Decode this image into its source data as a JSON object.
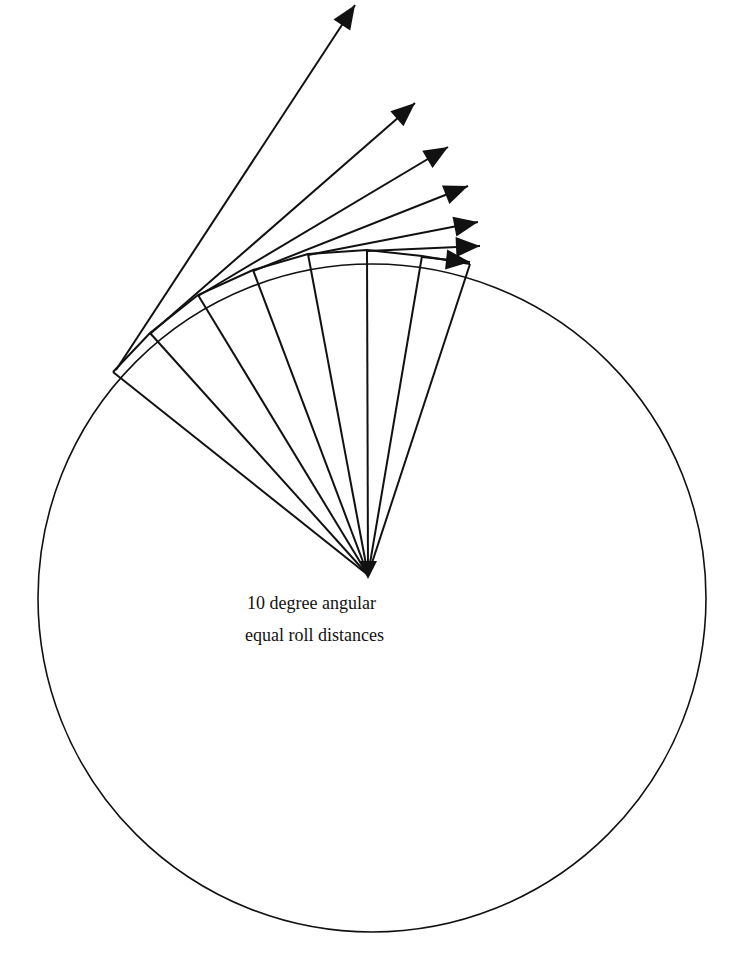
{
  "figure": {
    "caption_line1": "10 degree angular",
    "caption_line2": "equal roll distances",
    "stroke_color": "#111111",
    "background_color": "#ffffff",
    "circle": {
      "cx": 372,
      "cy": 598,
      "r": 334
    },
    "fan_origin": {
      "x": 368,
      "y": 575
    },
    "spoke_ends": [
      [
        470,
        264
      ],
      [
        422,
        256
      ],
      [
        367,
        250
      ],
      [
        308,
        254
      ],
      [
        253,
        270
      ],
      [
        198,
        295
      ],
      [
        150,
        333
      ],
      [
        113,
        372
      ]
    ],
    "tangent_arrows": [
      {
        "from": [
          116,
          370
        ],
        "to": [
          355,
          5
        ]
      },
      {
        "from": [
          150,
          334
        ],
        "to": [
          415,
          103
        ]
      },
      {
        "from": [
          198,
          296
        ],
        "to": [
          448,
          147
        ]
      },
      {
        "from": [
          253,
          271
        ],
        "to": [
          468,
          186
        ]
      },
      {
        "from": [
          308,
          255
        ],
        "to": [
          478,
          222
        ]
      },
      {
        "from": [
          367,
          251
        ],
        "to": [
          480,
          246
        ]
      },
      {
        "from": [
          422,
          257
        ],
        "to": [
          470,
          262
        ]
      }
    ]
  }
}
